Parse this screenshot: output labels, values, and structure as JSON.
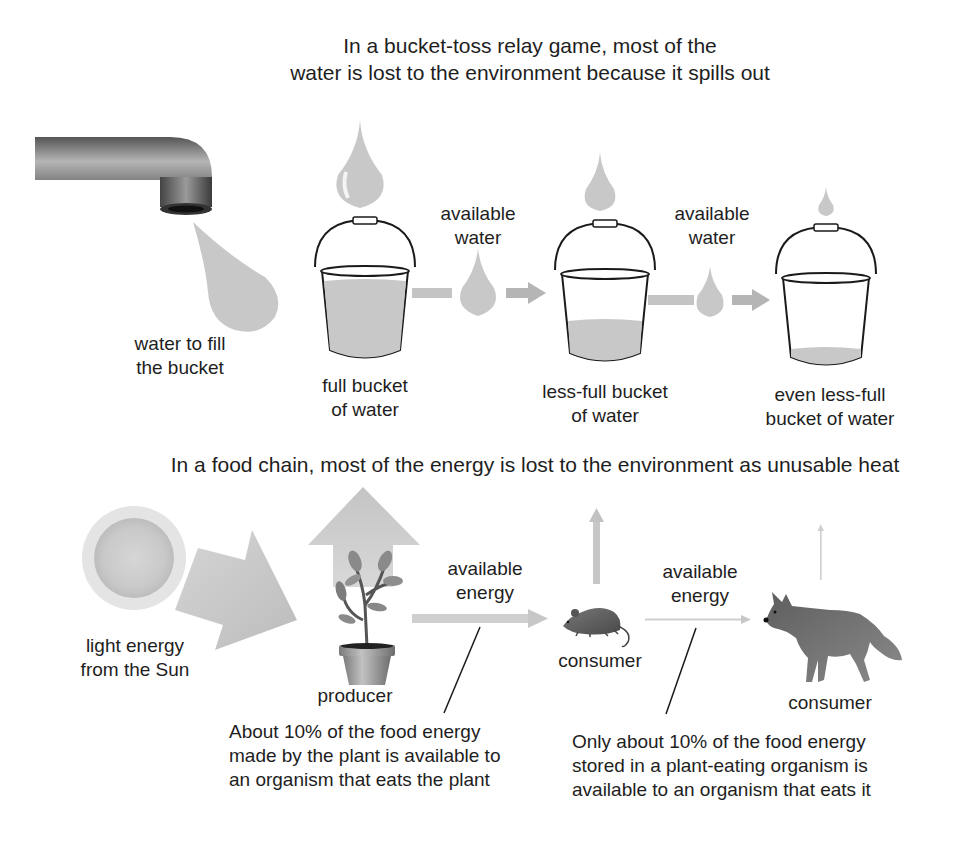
{
  "water_section": {
    "title_line1": "In a bucket-toss relay game, most of the",
    "title_line2": "water is lost to the environment because it spills out",
    "faucet_label_line1": "water to fill",
    "faucet_label_line2": "the bucket",
    "buckets": [
      {
        "label_line1": "full bucket",
        "label_line2": "of water",
        "fill_level": 0.95
      },
      {
        "label_line1": "less-full bucket",
        "label_line2": "of water",
        "fill_level": 0.4
      },
      {
        "label_line1": "even less-full",
        "label_line2": "bucket of water",
        "fill_level": 0.12
      }
    ],
    "transfers": [
      {
        "label_line1": "available",
        "label_line2": "water"
      },
      {
        "label_line1": "available",
        "label_line2": "water"
      }
    ]
  },
  "energy_section": {
    "title": "In a food chain, most of the energy is lost to the environment as unusable heat",
    "sun_label_line1": "light energy",
    "sun_label_line2": "from the Sun",
    "producer_label": "producer",
    "consumer1_label": "consumer",
    "consumer2_label": "consumer",
    "transfers": [
      {
        "label_line1": "available",
        "label_line2": "energy"
      },
      {
        "label_line1": "available",
        "label_line2": "energy"
      }
    ],
    "note1_line1": "About 10% of the food energy",
    "note1_line2": "made by the plant is available to",
    "note1_line3": "an organism that eats the plant",
    "note2_line1": "Only about 10% of the food energy",
    "note2_line2": "stored in a plant-eating organism is",
    "note2_line3": "available to an organism that eats it"
  },
  "colors": {
    "water_gray": "#c8c8c8",
    "arrow_gray": "#bdbdbd",
    "text": "#1e1e1e",
    "outline": "#1a1a1a"
  }
}
